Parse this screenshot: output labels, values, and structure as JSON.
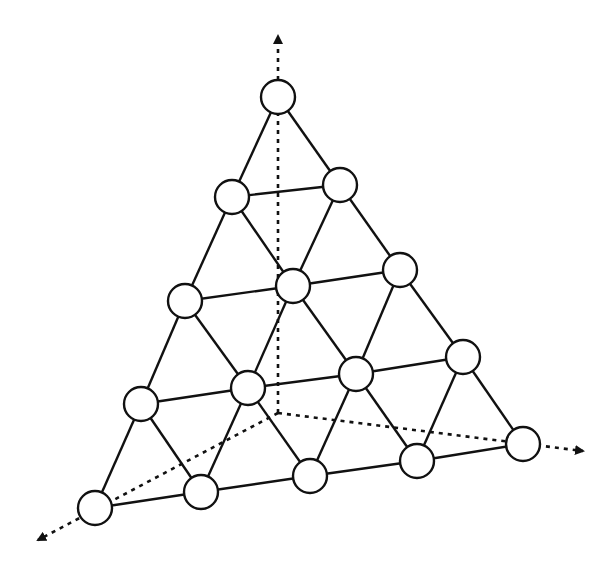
{
  "diagram": {
    "type": "triangular-lattice-with-3d-axes",
    "colors": {
      "line": "#111111",
      "node_fill": "#ffffff",
      "background": "#ffffff"
    },
    "node_radius": 17,
    "axes": {
      "origin": [
        278,
        413
      ],
      "arrows": [
        {
          "name": "axis-up",
          "to": [
            278,
            36
          ]
        },
        {
          "name": "axis-left",
          "to": [
            38,
            540
          ]
        },
        {
          "name": "axis-right",
          "to": [
            583,
            451
          ]
        }
      ]
    },
    "rows": [
      [
        [
          278,
          97
        ]
      ],
      [
        [
          232,
          197
        ],
        [
          340,
          185
        ]
      ],
      [
        [
          185,
          301
        ],
        [
          293,
          286
        ],
        [
          400,
          270
        ]
      ],
      [
        [
          141,
          404
        ],
        [
          248,
          388
        ],
        [
          356,
          374
        ],
        [
          463,
          357
        ]
      ],
      [
        [
          95,
          508
        ],
        [
          201,
          492
        ],
        [
          310,
          476
        ],
        [
          417,
          461
        ],
        [
          523,
          444
        ]
      ]
    ]
  }
}
